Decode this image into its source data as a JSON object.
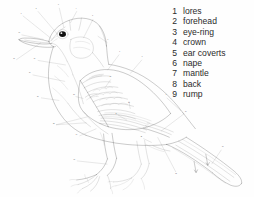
{
  "figure": {
    "background_color": "#ffffff",
    "line_color": "#1d1d1d"
  },
  "legend": {
    "entries": [
      {
        "num": "1",
        "label": "lores"
      },
      {
        "num": "2",
        "label": "forehead"
      },
      {
        "num": "3",
        "label": "eye-ring"
      },
      {
        "num": "4",
        "label": "crown"
      },
      {
        "num": "5",
        "label": "ear coverts"
      },
      {
        "num": "6",
        "label": "nape"
      },
      {
        "num": "7",
        "label": "mantle"
      },
      {
        "num": "8",
        "label": "back"
      },
      {
        "num": "9",
        "label": "rump"
      }
    ]
  },
  "callouts": [
    {
      "num": "1",
      "x": 64,
      "y": 42
    },
    {
      "num": "2",
      "x": 110,
      "y": 27
    },
    {
      "num": "3",
      "x": 178,
      "y": 16
    },
    {
      "num": "4",
      "x": 233,
      "y": 26
    },
    {
      "num": "5",
      "x": 283,
      "y": 50
    },
    {
      "num": "6",
      "x": 330,
      "y": 122
    },
    {
      "num": "7",
      "x": 366,
      "y": 158
    },
    {
      "num": "8",
      "x": 435,
      "y": 173
    },
    {
      "num": "9",
      "x": 509,
      "y": 290
    },
    {
      "num": "10",
      "x": 568,
      "y": 340
    },
    {
      "num": "11",
      "x": 682,
      "y": 448
    },
    {
      "num": "12",
      "x": 538,
      "y": 531
    },
    {
      "num": "13",
      "x": 226,
      "y": 487
    },
    {
      "num": "14",
      "x": 233,
      "y": 411
    },
    {
      "num": "15",
      "x": 114,
      "y": 296
    },
    {
      "num": "16",
      "x": 89,
      "y": 222
    },
    {
      "num": "17",
      "x": 104,
      "y": 179
    },
    {
      "num": "18",
      "x": 41,
      "y": 179
    },
    {
      "num": "19",
      "x": 57,
      "y": 101
    },
    {
      "num": "20",
      "x": 337,
      "y": 236
    },
    {
      "num": "21",
      "x": 394,
      "y": 314
    },
    {
      "num": "22",
      "x": 163,
      "y": 378
    },
    {
      "num": "23",
      "x": 225,
      "y": 289
    },
    {
      "num": "24",
      "x": 355,
      "y": 346
    },
    {
      "num": "25",
      "x": 432,
      "y": 418
    }
  ]
}
